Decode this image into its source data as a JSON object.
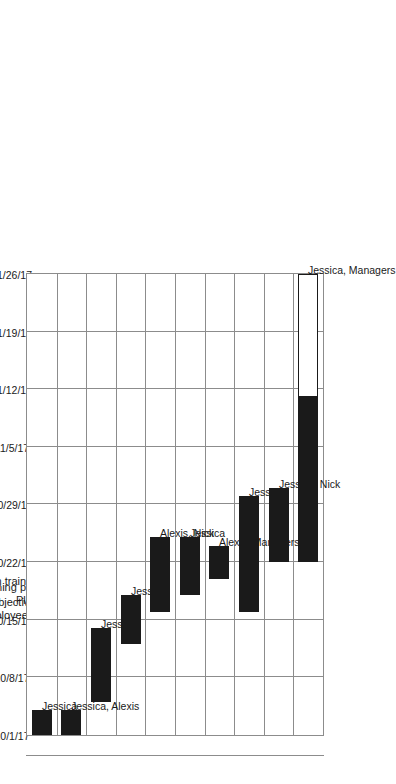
{
  "chart_data": {
    "type": "bar",
    "chart_subtype": "gantt",
    "title": "",
    "xlabel": "",
    "ylabel": "",
    "orientation": "rotated-90-ccw",
    "time_axis": {
      "start": "10/1/17",
      "end": "11/26/17",
      "tick_labels": [
        "10/1/17",
        "10/8/17",
        "10/15/17",
        "10/22/17",
        "10/29/17",
        "11/5/17",
        "11/12/17",
        "11/19/17",
        "11/26/17"
      ],
      "tick_interval_days": 7,
      "total_days": 56,
      "grid": true
    },
    "categories": [
      "Determine training objectives",
      "Identify employees to train",
      "Design training program content",
      "Design training program methods",
      "Plan budget and obtain funds",
      "Practice the training program",
      "Schedule employees for training",
      "Train the employees",
      "Evaluate training program",
      "Monitor training outcomes"
    ],
    "tasks": [
      {
        "name": "Determine training objectives",
        "resource": "Jessica",
        "start": "10/1/17",
        "end": "10/4/17",
        "start_day": 0,
        "duration_days": 3,
        "progress_days": 3
      },
      {
        "name": "Identify employees to train",
        "resource": "Jessica, Alexis",
        "start": "10/1/17",
        "end": "10/4/17",
        "start_day": 0,
        "duration_days": 3,
        "progress_days": 3
      },
      {
        "name": "Design training program content",
        "resource": "Jessica",
        "start": "10/5/17",
        "end": "10/13/17",
        "start_day": 4,
        "duration_days": 9,
        "progress_days": 9
      },
      {
        "name": "Design training program methods",
        "resource": "Jessica",
        "start": "10/12/17",
        "end": "10/17/17",
        "start_day": 11,
        "duration_days": 6,
        "progress_days": 6
      },
      {
        "name": "Plan budget and obtain funds",
        "resource": "Alexis, Nick",
        "start": "10/16/17",
        "end": "10/24/17",
        "start_day": 15,
        "duration_days": 9,
        "progress_days": 9
      },
      {
        "name": "Practice the training program",
        "resource": "Jessica",
        "start": "10/18/17",
        "end": "10/24/17",
        "start_day": 17,
        "duration_days": 7,
        "progress_days": 7
      },
      {
        "name": "Schedule employees for training",
        "resource": "Alexis, Managers",
        "start": "10/20/17",
        "end": "10/23/17",
        "start_day": 19,
        "duration_days": 4,
        "progress_days": 4
      },
      {
        "name": "Train the employees",
        "resource": "Jessica",
        "start": "10/16/17",
        "end": "10/29/17",
        "start_day": 15,
        "duration_days": 14,
        "progress_days": 14
      },
      {
        "name": "Evaluate training program",
        "resource": "Jessica, Nick",
        "start": "10/22/17",
        "end": "10/30/17",
        "start_day": 21,
        "duration_days": 9,
        "progress_days": 9
      },
      {
        "name": "Monitor training outcomes",
        "resource": "Jessica, Managers",
        "start": "10/22/17",
        "end": "11/26/17",
        "start_day": 21,
        "duration_days": 35,
        "progress_days": 20
      }
    ],
    "resources": [
      "Jessica",
      "Alexis",
      "Nick",
      "Managers"
    ],
    "colors": {
      "bar_fill": "#1a1a1a",
      "bar_remaining_fill": "#ffffff",
      "bar_outline": "#1a1a1a",
      "grid": "#8c8c8c",
      "background": "#ffffff",
      "text": "#1a1a1a"
    }
  }
}
